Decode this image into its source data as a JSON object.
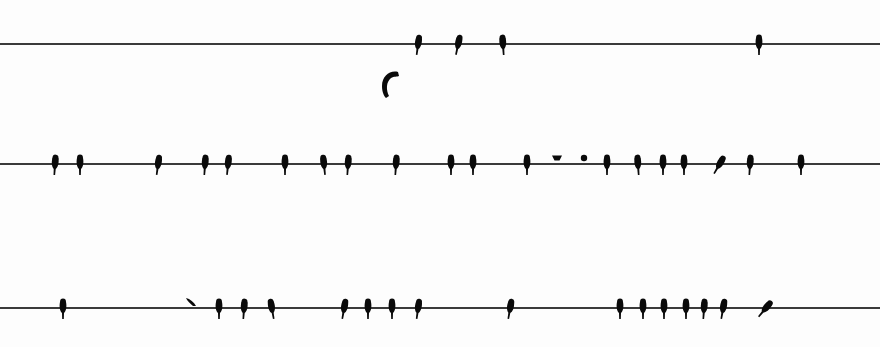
{
  "scene": {
    "description": "Black silhouettes of small birds perched on three horizontal power lines against a white sky",
    "background": "#fdfdfd",
    "bird_color": "#0a0a0a",
    "wire_color": "#3a3a3a"
  },
  "wires": [
    {
      "name": "top-wire",
      "y": 43,
      "birds": [
        {
          "x": 418,
          "tilt": 8
        },
        {
          "x": 458,
          "tilt": 12
        },
        {
          "x": 503,
          "tilt": -4
        },
        {
          "x": 759,
          "tilt": 0
        }
      ]
    },
    {
      "name": "middle-wire",
      "y": 163,
      "birds": [
        {
          "x": 55,
          "tilt": 4
        },
        {
          "x": 80,
          "tilt": 0
        },
        {
          "x": 158,
          "tilt": 8
        },
        {
          "x": 205,
          "tilt": 4
        },
        {
          "x": 228,
          "tilt": 6
        },
        {
          "x": 285,
          "tilt": 0
        },
        {
          "x": 324,
          "tilt": -6
        },
        {
          "x": 348,
          "tilt": 4
        },
        {
          "x": 396,
          "tilt": 4
        },
        {
          "x": 451,
          "tilt": 0
        },
        {
          "x": 473,
          "tilt": 0
        },
        {
          "x": 527,
          "tilt": 0
        },
        {
          "x": 607,
          "tilt": 0
        },
        {
          "x": 638,
          "tilt": -4
        },
        {
          "x": 663,
          "tilt": 0
        },
        {
          "x": 684,
          "tilt": 0
        },
        {
          "x": 719,
          "tilt": 30
        },
        {
          "x": 750,
          "tilt": 4
        },
        {
          "x": 801,
          "tilt": 0
        }
      ],
      "perched_low": [
        {
          "x": 557,
          "shape": "crouched"
        },
        {
          "x": 584,
          "shape": "round"
        }
      ]
    },
    {
      "name": "bottom-wire",
      "y": 307,
      "birds": [
        {
          "x": 63,
          "tilt": 0
        },
        {
          "x": 219,
          "tilt": 0
        },
        {
          "x": 244,
          "tilt": 4
        },
        {
          "x": 272,
          "tilt": -10
        },
        {
          "x": 344,
          "tilt": 10
        },
        {
          "x": 368,
          "tilt": 0
        },
        {
          "x": 392,
          "tilt": 0
        },
        {
          "x": 418,
          "tilt": 8
        },
        {
          "x": 510,
          "tilt": 10
        },
        {
          "x": 620,
          "tilt": 0
        },
        {
          "x": 643,
          "tilt": 0
        },
        {
          "x": 664,
          "tilt": 0
        },
        {
          "x": 686,
          "tilt": 0
        },
        {
          "x": 704,
          "tilt": 4
        },
        {
          "x": 723,
          "tilt": 10
        },
        {
          "x": 765,
          "tilt": 40
        }
      ],
      "perched_low": [
        {
          "x": 191,
          "shape": "tilted"
        }
      ]
    }
  ],
  "flying_bird": {
    "x": 378,
    "y": 68,
    "shape": "curved-wing"
  }
}
